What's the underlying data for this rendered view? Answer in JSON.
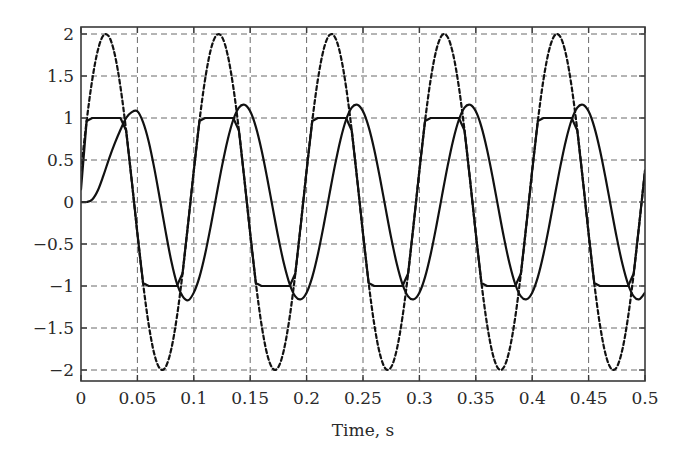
{
  "chart_data": {
    "type": "line",
    "title": "",
    "xlabel": "Time, s",
    "ylabel": "",
    "xlim": [
      0,
      0.5
    ],
    "ylim": [
      -2.1,
      2.1
    ],
    "grid": true,
    "legend": null,
    "x_ticks": [
      "0",
      "0.05",
      "0.1",
      "0.15",
      "0.2",
      "0.25",
      "0.3",
      "0.35",
      "0.4",
      "0.45",
      "0.5"
    ],
    "x_tick_values": [
      0,
      0.05,
      0.1,
      0.15,
      0.2,
      0.25,
      0.3,
      0.35,
      0.4,
      0.45,
      0.5
    ],
    "y_ticks": [
      "2",
      "1.5",
      "1",
      "0.5",
      "0",
      "−0.5",
      "−1",
      "−1.5",
      "−2"
    ],
    "y_tick_values": [
      2,
      1.5,
      1,
      0.5,
      0,
      -0.5,
      -1,
      -1.5,
      -2
    ],
    "x_step": 0.005,
    "series": [
      {
        "name": "reference sine (dashed)",
        "style": "dashed",
        "values": [
          0.375,
          0.964,
          1.458,
          1.81,
          1.984,
          1.965,
          1.753,
          1.369,
          0.852,
          0.251,
          -0.375,
          -0.964,
          -1.458,
          -1.81,
          -1.984,
          -1.965,
          -1.753,
          -1.369,
          -0.852,
          -0.251,
          0.375,
          0.964,
          1.458,
          1.81,
          1.984,
          1.965,
          1.753,
          1.369,
          0.852,
          0.251,
          -0.375,
          -0.964,
          -1.458,
          -1.81,
          -1.984,
          -1.965,
          -1.753,
          -1.369,
          -0.852,
          -0.251,
          0.375,
          0.964,
          1.458,
          1.81,
          1.984,
          1.965,
          1.753,
          1.369,
          0.852,
          0.251,
          -0.375,
          -0.964,
          -1.458,
          -1.81,
          -1.984,
          -1.965,
          -1.753,
          -1.369,
          -0.852,
          -0.251,
          0.375,
          0.964,
          1.458,
          1.81,
          1.984,
          1.965,
          1.753,
          1.369,
          0.852,
          0.251,
          -0.375,
          -0.964,
          -1.458,
          -1.81,
          -1.984,
          -1.965,
          -1.753,
          -1.369,
          -0.852,
          -0.251,
          0.375,
          0.964,
          1.458,
          1.81,
          1.984,
          1.965,
          1.753,
          1.369,
          0.852,
          0.251,
          -0.375,
          -0.964,
          -1.458,
          -1.81,
          -1.984,
          -1.965,
          -1.753,
          -1.369,
          -0.852,
          -0.251,
          0.375
        ]
      },
      {
        "name": "clipped signal (solid, limited at ±1)",
        "style": "solid-linear",
        "values": [
          0.15,
          0.964,
          1,
          1,
          1,
          1,
          1,
          1,
          0.852,
          0.251,
          -0.375,
          -0.964,
          -1,
          -1,
          -1,
          -1,
          -1,
          -1,
          -0.852,
          -0.251,
          0.375,
          0.964,
          1,
          1,
          1,
          1,
          1,
          1,
          0.852,
          0.251,
          -0.375,
          -0.964,
          -1,
          -1,
          -1,
          -1,
          -1,
          -1,
          -0.852,
          -0.251,
          0.375,
          0.964,
          1,
          1,
          1,
          1,
          1,
          1,
          0.852,
          0.251,
          -0.375,
          -0.964,
          -1,
          -1,
          -1,
          -1,
          -1,
          -1,
          -0.852,
          -0.251,
          0.375,
          0.964,
          1,
          1,
          1,
          1,
          1,
          1,
          0.852,
          0.251,
          -0.375,
          -0.964,
          -1,
          -1,
          -1,
          -1,
          -1,
          -1,
          -0.852,
          -0.251,
          0.375,
          0.964,
          1,
          1,
          1,
          1,
          1,
          1,
          0.852,
          0.251,
          -0.375,
          -0.964,
          -1,
          -1,
          -1,
          -1,
          -1,
          -1,
          -0.852,
          -0.251,
          0.375
        ]
      },
      {
        "name": "filtered output (solid, smooth)",
        "style": "solid-smooth",
        "values": [
          0,
          0.0,
          0.03,
          0.14,
          0.32,
          0.52,
          0.7,
          0.86,
          1.0,
          1.07,
          1.08,
          0.95,
          0.72,
          0.4,
          0.03,
          -0.35,
          -0.7,
          -0.97,
          -1.12,
          -1.17,
          -1.079,
          -0.894,
          -0.622,
          -0.289,
          0.073,
          0.427,
          0.739,
          0.979,
          1.124,
          1.158,
          1.079,
          0.894,
          0.622,
          0.289,
          -0.073,
          -0.427,
          -0.739,
          -0.979,
          -1.124,
          -1.158,
          -1.079,
          -0.894,
          -0.622,
          -0.289,
          0.073,
          0.427,
          0.739,
          0.979,
          1.124,
          1.158,
          1.079,
          0.894,
          0.622,
          0.289,
          -0.073,
          -0.427,
          -0.739,
          -0.979,
          -1.124,
          -1.158,
          -1.079,
          -0.894,
          -0.622,
          -0.289,
          0.073,
          0.427,
          0.739,
          0.979,
          1.124,
          1.158,
          1.079,
          0.894,
          0.622,
          0.289,
          -0.073,
          -0.427,
          -0.739,
          -0.979,
          -1.124,
          -1.158,
          -1.079,
          -0.894,
          -0.622,
          -0.289,
          0.073,
          0.427,
          0.739,
          0.979,
          1.124,
          1.158,
          1.079,
          0.894,
          0.622,
          0.289,
          -0.073,
          -0.427,
          -0.739,
          -0.979,
          -1.124,
          -1.158,
          -1.079
        ]
      }
    ]
  },
  "colors": {
    "curve": "#111111",
    "grid": "#6a6a6a",
    "frame": "#3a3a3a",
    "text": "#2a2a2a"
  }
}
